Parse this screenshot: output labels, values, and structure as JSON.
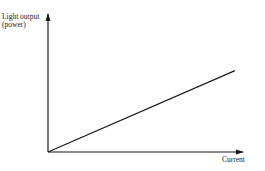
{
  "chart_data": {
    "type": "line",
    "title": "",
    "xlabel": "Current",
    "ylabel": "Light output (power)",
    "ylabel_lines": [
      "Light output",
      "(power)"
    ],
    "x": [
      0,
      1
    ],
    "series": [
      {
        "name": "Light output vs current",
        "values": [
          0,
          0.59
        ]
      }
    ],
    "axis_ticks": "none",
    "grid": false,
    "legend": "none"
  }
}
